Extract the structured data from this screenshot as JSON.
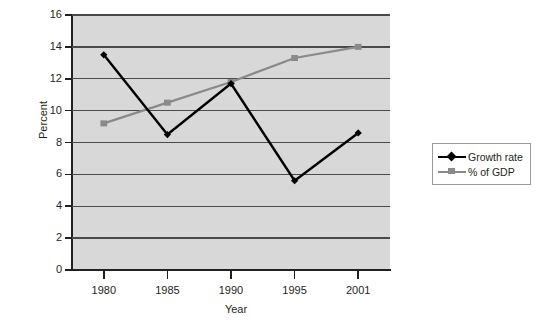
{
  "chart_data": {
    "type": "line",
    "title": "",
    "xlabel": "Year",
    "ylabel": "Percent",
    "categories": [
      "1980",
      "1985",
      "1990",
      "1995",
      "2001"
    ],
    "x": [
      1980,
      1985,
      1990,
      1995,
      2001
    ],
    "ylim": [
      0,
      16
    ],
    "yticks": [
      0,
      2,
      4,
      6,
      8,
      10,
      12,
      14,
      16
    ],
    "ytick_labels": [
      "0",
      "2",
      "4",
      "6",
      "8",
      "10",
      "12",
      "14",
      "16"
    ],
    "grid": true,
    "grid_axis": "y",
    "legend_position": "right",
    "plot_background": "#d8d8d8",
    "series": [
      {
        "name": "Growth rate",
        "color": "#000000",
        "marker": "diamond",
        "values": [
          13.5,
          8.5,
          11.7,
          5.6,
          8.6
        ]
      },
      {
        "name": "% of GDP",
        "color": "#8a8a8a",
        "marker": "square",
        "values": [
          9.2,
          10.5,
          11.8,
          13.3,
          14.0
        ]
      }
    ]
  },
  "legend": {
    "entries": [
      {
        "label": "Growth rate"
      },
      {
        "label": "% of GDP"
      }
    ]
  },
  "colors": {
    "growth_rate": "#000000",
    "pct_of_gdp": "#8a8a8a",
    "plot_bg": "#d8d8d8",
    "gridline": "#4a4a4a",
    "axis": "#231f20"
  }
}
